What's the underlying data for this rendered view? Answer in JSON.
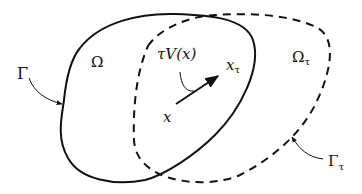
{
  "diagram": {
    "labels": {
      "omega": "Ω",
      "omega_tau": "Ω",
      "omega_tau_sub": "τ",
      "gamma": "Γ",
      "gamma_tau": "Γ",
      "gamma_tau_sub": "τ",
      "tau_v": "τV(x)",
      "x": "x",
      "x_tau": "x",
      "x_tau_sub": "τ"
    },
    "colors": {
      "stroke": "#111111",
      "background": "#ffffff"
    }
  }
}
